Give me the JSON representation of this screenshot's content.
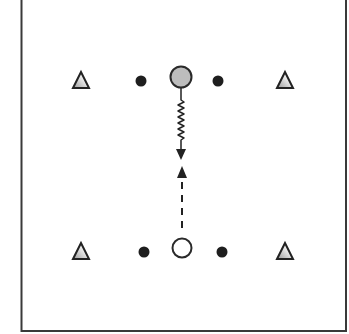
{
  "diagram": {
    "type": "drill-diagram",
    "field": {
      "border_color": "#3a3a3a",
      "left": 21,
      "right": 346,
      "bottom": 331,
      "top": -2
    },
    "cones": [
      {
        "id": "cone-top-left",
        "x": 81,
        "y": 80
      },
      {
        "id": "cone-top-right",
        "x": 285,
        "y": 80
      },
      {
        "id": "cone-bottom-left",
        "x": 81,
        "y": 251
      },
      {
        "id": "cone-bottom-right",
        "x": 285,
        "y": 251
      }
    ],
    "defenders": [
      {
        "id": "dot-top-left",
        "x": 141,
        "y": 81
      },
      {
        "id": "dot-top-right",
        "x": 218,
        "y": 81
      },
      {
        "id": "dot-bottom-left",
        "x": 144,
        "y": 252
      },
      {
        "id": "dot-bottom-right",
        "x": 222,
        "y": 252
      }
    ],
    "players": [
      {
        "id": "player-top",
        "x": 181,
        "y": 77,
        "r": 11,
        "fill": "#bdbdbd"
      },
      {
        "id": "player-bottom",
        "x": 182,
        "y": 248,
        "r": 10,
        "fill": "#ffffff"
      }
    ],
    "movements": [
      {
        "id": "dribble-path",
        "style": "zigzag",
        "from": [
          181,
          88
        ],
        "to": [
          181,
          158
        ]
      },
      {
        "id": "run-path",
        "style": "dashed",
        "from": [
          182,
          236
        ],
        "to": [
          182,
          166
        ]
      }
    ],
    "colors": {
      "stroke": "#222222",
      "cone_shade": "#a8a8a8",
      "dot": "#1e1e1e"
    }
  }
}
